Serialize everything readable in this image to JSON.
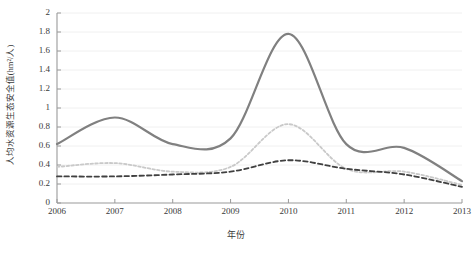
{
  "chart_data": {
    "type": "line",
    "title": "",
    "xlabel": "年份",
    "ylabel": "人均水资源生态安全值(hm²/人)",
    "categories": [
      "2006",
      "2007",
      "2008",
      "2009",
      "2010",
      "2011",
      "2012",
      "2013"
    ],
    "x": [
      2006,
      2007,
      2008,
      2009,
      2010,
      2011,
      2012,
      2013
    ],
    "xlim": [
      2006,
      2013
    ],
    "ylim": [
      0,
      2
    ],
    "y_ticks": [
      0,
      0.2,
      0.4,
      0.6,
      0.8,
      1,
      1.2,
      1.4,
      1.6,
      1.8,
      2
    ],
    "y_tick_labels": [
      "0",
      "0.2",
      "0.4",
      "0.6",
      "0.8",
      "1",
      "1.2",
      "1.4",
      "1.6",
      "1.8",
      "2"
    ],
    "grid": "horizontal",
    "legend": "none",
    "smoothing": "spline",
    "series": [
      {
        "name": "series-solid",
        "style": "solid",
        "color": "#808080",
        "width": 2.2,
        "values": [
          0.62,
          0.9,
          0.62,
          0.68,
          1.78,
          0.62,
          0.58,
          0.23
        ]
      },
      {
        "name": "series-dotted",
        "style": "dotted",
        "color": "#c9c9c9",
        "width": 1.8,
        "values": [
          0.38,
          0.42,
          0.33,
          0.38,
          0.83,
          0.36,
          0.33,
          0.19
        ]
      },
      {
        "name": "series-dashed",
        "style": "dashed",
        "color": "#404040",
        "width": 1.8,
        "values": [
          0.28,
          0.28,
          0.3,
          0.33,
          0.45,
          0.36,
          0.3,
          0.17
        ]
      }
    ]
  },
  "axes": {
    "y_title": "人均水资源生态安全值(hm²/人)",
    "x_title": "年份"
  },
  "colors": {
    "axis": "#9a9a9a",
    "grid": "#f0f0f0",
    "text": "#3a3a3a",
    "series_solid": "#808080",
    "series_dotted": "#c9c9c9",
    "series_dashed": "#404040",
    "background": "#ffffff"
  }
}
